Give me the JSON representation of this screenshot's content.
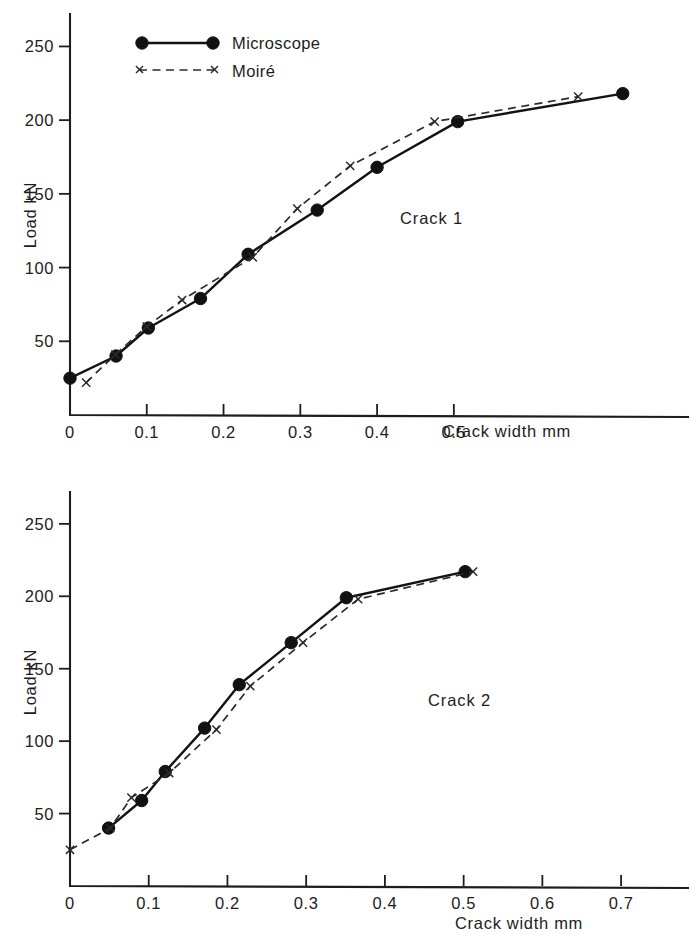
{
  "figure": {
    "background": "#ffffff",
    "ink_color": "#161616",
    "panels": [
      "crack-1",
      "crack-2"
    ]
  },
  "legend": {
    "position": "top-left-inside-plot",
    "entries": [
      {
        "label": "Microscope",
        "style": "solid-line-with-filled-circles",
        "marker": "circle-marker"
      },
      {
        "label": "Moiré",
        "style": "dashed-line-with-x-markers",
        "marker": "x-marker"
      }
    ]
  },
  "chart_data": [
    {
      "id": "crack-1",
      "type": "line",
      "title": "",
      "annotation": "Crack 1",
      "xlabel": "Crack width mm",
      "ylabel": "Load kN",
      "xlim": [
        0,
        0.805
      ],
      "ylim": [
        0,
        272
      ],
      "grid": false,
      "xticks": [
        0,
        0.1,
        0.2,
        0.3,
        0.4,
        0.5
      ],
      "xticklabels": [
        "0",
        "0.1",
        "0.2",
        "0.3",
        "0.4",
        "0.5"
      ],
      "yticks": [
        50,
        100,
        150,
        200,
        250
      ],
      "yticklabels": [
        "50",
        "100",
        "150",
        "200",
        "250"
      ],
      "legend_position": "upper left",
      "series": [
        {
          "name": "Microscope",
          "marker": "circle",
          "linestyle": "solid",
          "x": [
            0.0,
            0.06,
            0.102,
            0.17,
            0.232,
            0.322,
            0.4,
            0.505,
            0.72
          ],
          "y": [
            25,
            40,
            59,
            79,
            109,
            139,
            168,
            199,
            218
          ]
        },
        {
          "name": "Moiré",
          "marker": "x",
          "linestyle": "dashed",
          "x": [
            0.021,
            0.059,
            0.1,
            0.146,
            0.238,
            0.296,
            0.365,
            0.475,
            0.662
          ],
          "y": [
            22,
            41,
            60,
            78,
            107,
            140,
            169,
            199,
            216
          ]
        }
      ]
    },
    {
      "id": "crack-2",
      "type": "line",
      "title": "",
      "annotation": "Crack 2",
      "xlabel": "Crack  width mm",
      "ylabel": "Load kN",
      "xlim": [
        0,
        0.785
      ],
      "ylim": [
        0,
        272
      ],
      "grid": false,
      "xticks": [
        0,
        0.1,
        0.2,
        0.3,
        0.4,
        0.5,
        0.6,
        0.7
      ],
      "xticklabels": [
        "0",
        "0.1",
        "0.2",
        "0.3",
        "0.4",
        "0.5",
        "0.6",
        "0.7"
      ],
      "yticks": [
        50,
        100,
        150,
        200,
        250
      ],
      "yticklabels": [
        "50",
        "100",
        "150",
        "200",
        "250"
      ],
      "legend_position": "none",
      "series": [
        {
          "name": "Microscope",
          "marker": "circle",
          "linestyle": "solid",
          "x": [
            0.049,
            0.091,
            0.121,
            0.171,
            0.215,
            0.281,
            0.351,
            0.502
          ],
          "y": [
            40,
            59,
            79,
            109,
            139,
            168,
            199,
            217
          ]
        },
        {
          "name": "Moiré",
          "marker": "x",
          "linestyle": "dashed",
          "x": [
            0.0,
            0.051,
            0.078,
            0.126,
            0.186,
            0.229,
            0.296,
            0.366,
            0.512
          ],
          "y": [
            25,
            40,
            61,
            78,
            108,
            138,
            168,
            198,
            217
          ]
        }
      ]
    }
  ]
}
